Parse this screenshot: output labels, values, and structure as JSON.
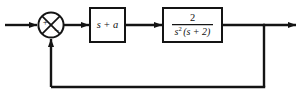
{
  "diagram": {
    "type": "control-system-block-diagram",
    "background_color": "#ffffff",
    "line_color": "#141414",
    "text_color": "#111111",
    "summing_junction": {
      "name": "summing-junction",
      "shape": "circle-with-x",
      "center_x": 51,
      "center_y": 25,
      "radius": 13,
      "input_sign": "+",
      "feedback_sign": "−"
    },
    "blocks": [
      {
        "id": "controller",
        "label": "s + a",
        "x": 90,
        "y": 8,
        "width": 35,
        "height": 34,
        "kind": "plain"
      },
      {
        "id": "plant",
        "numerator": "2",
        "denominator_base": "s",
        "denominator_exponent": "2",
        "denominator_tail": "(s + 2)",
        "x": 163,
        "y": 8,
        "width": 59,
        "height": 34,
        "kind": "fraction"
      }
    ],
    "signals": [
      {
        "id": "input-signal",
        "from_x": 5,
        "to_x": 38,
        "y": 25,
        "arrow": true
      },
      {
        "id": "error-signal",
        "from_x": 64,
        "to_x": 90,
        "y": 25,
        "arrow": true
      },
      {
        "id": "controller-output-signal",
        "from_x": 125,
        "to_x": 163,
        "y": 25,
        "arrow": true
      },
      {
        "id": "output-signal",
        "from_x": 222,
        "to_x": 297,
        "y": 25,
        "arrow": true
      }
    ],
    "feedback_path": {
      "id": "feedback-path",
      "takeoff_x": 264,
      "takeoff_y": 25,
      "bottom_y": 87,
      "return_x": 51,
      "arrow_target_y": 38,
      "arrow": true
    }
  }
}
